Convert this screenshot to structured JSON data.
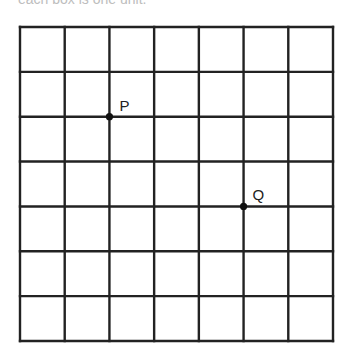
{
  "caption": "each box is one unit.",
  "grid": {
    "columns": 7,
    "rows": 7,
    "left": 20,
    "top": 27,
    "right": 333,
    "bottom": 341,
    "line_color": "#222222",
    "line_width": 2.4
  },
  "points": [
    {
      "name": "P",
      "col": 2,
      "row": 2,
      "label_dx": 10,
      "label_dy": -19
    },
    {
      "name": "Q",
      "col": 5,
      "row": 4,
      "label_dx": 9,
      "label_dy": -19
    }
  ]
}
